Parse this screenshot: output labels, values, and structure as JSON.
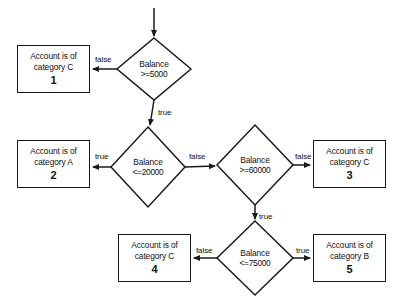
{
  "diagram": {
    "colors": {
      "stroke": "#1a1a1a",
      "background": "#ffffff",
      "text": "#111111"
    },
    "entry": {
      "name": "start-arrow"
    },
    "decisions": [
      {
        "id": "d1",
        "line1": "Balance",
        "line2": ">=5000",
        "cx": 154,
        "cy": 69,
        "rx": 37,
        "ry": 31
      },
      {
        "id": "d2",
        "line1": "Balance",
        "line2": "<=20000",
        "cx": 148,
        "cy": 167,
        "rx": 37,
        "ry": 40
      },
      {
        "id": "d3",
        "line1": "Balance",
        "line2": ">=60000",
        "cx": 255,
        "cy": 165,
        "rx": 38,
        "ry": 40
      },
      {
        "id": "d4",
        "line1": "Balance",
        "line2": "<=75000",
        "cx": 255,
        "cy": 258,
        "rx": 38,
        "ry": 37
      }
    ],
    "results": [
      {
        "id": "r1",
        "text": "Account is of\ncategory C",
        "number": "1",
        "x": 17,
        "y": 45,
        "w": 73,
        "h": 48
      },
      {
        "id": "r2",
        "text": "Account is of\ncategory A",
        "number": "2",
        "x": 17,
        "y": 140,
        "w": 73,
        "h": 48
      },
      {
        "id": "r3",
        "text": "Account is of\ncategory C",
        "number": "3",
        "x": 313,
        "y": 140,
        "w": 73,
        "h": 48
      },
      {
        "id": "r4",
        "text": "Account is of\ncategory C",
        "number": "4",
        "x": 118,
        "y": 234,
        "w": 73,
        "h": 48
      },
      {
        "id": "r5",
        "text": "Account is of\ncategory B",
        "number": "5",
        "x": 313,
        "y": 234,
        "w": 73,
        "h": 48
      }
    ],
    "edge_labels": [
      {
        "id": "e1",
        "text": "false",
        "x": 95,
        "y": 55
      },
      {
        "id": "e2",
        "text": "true",
        "x": 158,
        "y": 108
      },
      {
        "id": "e3",
        "text": "true",
        "x": 95,
        "y": 152
      },
      {
        "id": "e4",
        "text": "false",
        "x": 189,
        "y": 152
      },
      {
        "id": "e5",
        "text": "false",
        "x": 295,
        "y": 152
      },
      {
        "id": "e6",
        "text": "true",
        "x": 259,
        "y": 212
      },
      {
        "id": "e7",
        "text": "false",
        "x": 196,
        "y": 246
      },
      {
        "id": "e8",
        "text": "true",
        "x": 296,
        "y": 246
      }
    ]
  }
}
